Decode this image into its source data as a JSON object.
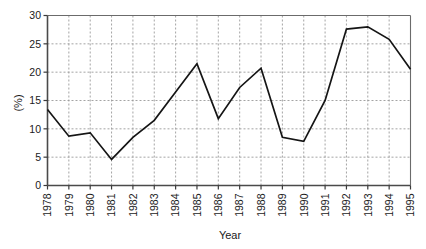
{
  "chart_data": {
    "type": "line",
    "title": "",
    "xlabel": "Year",
    "ylabel": "(%)",
    "categories": [
      "1978",
      "1979",
      "1980",
      "1981",
      "1982",
      "1983",
      "1984",
      "1985",
      "1986",
      "1987",
      "1988",
      "1989",
      "1990",
      "1991",
      "1992",
      "1993",
      "1994",
      "1995"
    ],
    "x": [
      1978,
      1979,
      1980,
      1981,
      1982,
      1983,
      1984,
      1985,
      1986,
      1987,
      1988,
      1989,
      1990,
      1991,
      1992,
      1993,
      1994,
      1995
    ],
    "values": [
      13.4,
      8.7,
      9.3,
      4.6,
      8.5,
      11.5,
      16.5,
      21.5,
      11.8,
      17.3,
      20.7,
      8.5,
      7.8,
      15.0,
      27.6,
      28.0,
      25.8,
      20.5
    ],
    "series": [
      {
        "name": "percent",
        "values": [
          13.4,
          8.7,
          9.3,
          4.6,
          8.5,
          11.5,
          16.5,
          21.5,
          11.8,
          17.3,
          20.7,
          8.5,
          7.8,
          15.0,
          27.6,
          28.0,
          25.8,
          20.5
        ]
      }
    ],
    "ylim": [
      0,
      30
    ],
    "xlim": [
      1978,
      1995
    ],
    "yticks": [
      0,
      5,
      10,
      15,
      20,
      25,
      30
    ],
    "ytick_labels": [
      "0",
      "5",
      "10",
      "15",
      "20",
      "25",
      "30"
    ],
    "xtick_labels": [
      "1978",
      "1979",
      "1980",
      "1981",
      "1982",
      "1983",
      "1984",
      "1985",
      "1986",
      "1987",
      "1988",
      "1989",
      "1990",
      "1991",
      "1992",
      "1993",
      "1994",
      "1995"
    ],
    "grid": true,
    "grid_style": "dashed",
    "legend": "none",
    "line_color": "#151515",
    "grid_color": "#9a9a9a",
    "axis_color": "#4a4a4a"
  }
}
